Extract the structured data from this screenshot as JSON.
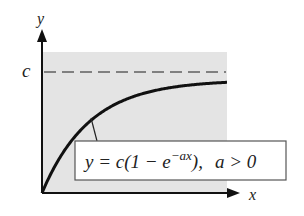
{
  "chart_data": {
    "type": "line",
    "title": "",
    "xlabel": "x",
    "ylabel": "y",
    "y_tick_labels": [
      "c"
    ],
    "asymptote": {
      "label": "c",
      "style": "dashed"
    },
    "series": [
      {
        "name": "y = c(1 − e^(−ax)), a > 0",
        "function": "c*(1-exp(-a*x))",
        "start": [
          0,
          0
        ],
        "limit": "c"
      }
    ],
    "annotation": {
      "lhs": "y = c(1 − e",
      "exponent": "−ax",
      "rhs": "),",
      "condition": "a > 0"
    },
    "grid": false,
    "background": "#e6e6e6"
  },
  "colors": {
    "plot_background": "#e4e4e4",
    "curve": "#111111",
    "dashed": "#808080",
    "axis": "#111111"
  }
}
